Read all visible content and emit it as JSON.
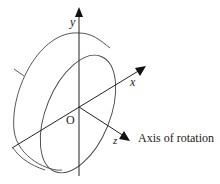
{
  "diagram": {
    "axes": {
      "x_label": "x",
      "y_label": "y",
      "z_label": "z",
      "origin_label": "O"
    },
    "annotation": "Axis of rotation",
    "colors": {
      "stroke": "#333333",
      "background": "#ffffff"
    }
  }
}
